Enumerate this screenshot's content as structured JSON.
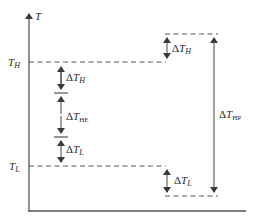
{
  "diagram": {
    "type": "temperature-difference-diagram",
    "axis": {
      "y_label": "T"
    },
    "levels": [
      {
        "id": "T_H",
        "label": "T",
        "sub": "H"
      },
      {
        "id": "T_L",
        "label": "T",
        "sub": "L"
      }
    ],
    "left_stack": [
      {
        "id": "dTH",
        "delta": "Δ",
        "label": "T",
        "sub": "H"
      },
      {
        "id": "dTHE",
        "delta": "Δ",
        "label": "T",
        "sub": "HE"
      },
      {
        "id": "dTL",
        "delta": "Δ",
        "label": "T",
        "sub": "L"
      }
    ],
    "right_stack": [
      {
        "id": "dTH_right",
        "delta": "Δ",
        "label": "T",
        "sub": "H"
      },
      {
        "id": "dTL_right",
        "delta": "Δ",
        "label": "T",
        "sub": "L"
      }
    ],
    "span": {
      "id": "dTHP",
      "delta": "Δ",
      "label": "T",
      "sub": "HP"
    },
    "colors": {
      "line": "#4a4a4a",
      "text": "#2a2a2a",
      "background": "#ffffff"
    }
  }
}
